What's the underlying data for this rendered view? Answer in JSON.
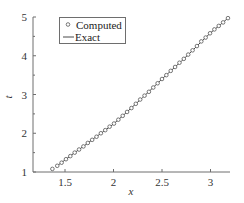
{
  "chart_data": {
    "type": "line",
    "title": "",
    "xlabel": "x",
    "ylabel": "t",
    "xlim": [
      1.17,
      3.2
    ],
    "ylim": [
      1,
      5
    ],
    "grid": false,
    "xticks": [
      1.5,
      2,
      2.5,
      3
    ],
    "xtick_labels": [
      "1.5",
      "2",
      "2.5",
      "3"
    ],
    "yticks": [
      1,
      2,
      3,
      4,
      5
    ],
    "ytick_labels": [
      "1",
      "2",
      "3",
      "4",
      "5"
    ],
    "minor_yticks": [
      1.5,
      2.5,
      3.5,
      4.5
    ],
    "legend": {
      "placement": "top-left",
      "entries": [
        {
          "label": "Computed",
          "style": "marker-circle"
        },
        {
          "label": "Exact",
          "style": "line"
        }
      ]
    },
    "series": [
      {
        "name": "Exact",
        "style": "line",
        "x": [
          1.42,
          1.5,
          1.6,
          1.7,
          1.8,
          1.9,
          2.0,
          2.1,
          2.2,
          2.3,
          2.4,
          2.5,
          2.6,
          2.7,
          2.8,
          2.9,
          3.0,
          3.1,
          3.18
        ],
        "y": [
          1.16,
          1.31,
          1.5,
          1.68,
          1.87,
          2.05,
          2.24,
          2.46,
          2.69,
          2.92,
          3.16,
          3.4,
          3.63,
          3.86,
          4.1,
          4.35,
          4.59,
          4.8,
          4.97
        ]
      },
      {
        "name": "Computed",
        "style": "marker-circle",
        "x": [
          1.37,
          1.42,
          1.465,
          1.51,
          1.555,
          1.6,
          1.645,
          1.69,
          1.735,
          1.78,
          1.825,
          1.87,
          1.915,
          1.96,
          2.005,
          2.05,
          2.095,
          2.14,
          2.185,
          2.23,
          2.275,
          2.32,
          2.365,
          2.41,
          2.455,
          2.5,
          2.545,
          2.59,
          2.635,
          2.68,
          2.725,
          2.77,
          2.815,
          2.86,
          2.905,
          2.95,
          2.995,
          3.04,
          3.085,
          3.13,
          3.18
        ],
        "y": [
          1.08,
          1.16,
          1.24,
          1.33,
          1.41,
          1.5,
          1.58,
          1.66,
          1.75,
          1.83,
          1.91,
          2.0,
          2.08,
          2.17,
          2.25,
          2.35,
          2.45,
          2.55,
          2.65,
          2.76,
          2.87,
          2.97,
          3.07,
          3.18,
          3.29,
          3.4,
          3.5,
          3.61,
          3.71,
          3.82,
          3.92,
          4.03,
          4.14,
          4.25,
          4.37,
          4.47,
          4.58,
          4.68,
          4.77,
          4.86,
          4.97
        ]
      }
    ]
  }
}
